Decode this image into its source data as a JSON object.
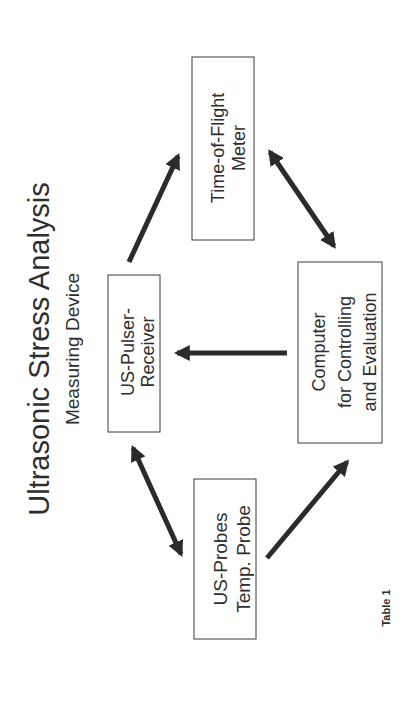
{
  "title": "Ultrasonic Stress Analysis",
  "subtitle": "Measuring Device",
  "caption": "Table 1",
  "nodes": {
    "tof": {
      "lines": [
        "Time-of-Flight",
        "Meter"
      ]
    },
    "pulser": {
      "lines": [
        "US-Pulser-",
        "Receiver"
      ]
    },
    "computer": {
      "lines": [
        "Computer",
        "for Controlling",
        "and Evaluation"
      ]
    },
    "probes": {
      "lines": [
        "US-Probes",
        "Temp. Probe"
      ]
    }
  },
  "edges": [
    {
      "from": "pulser",
      "to": "tof",
      "type": "one-way"
    },
    {
      "from": "tof",
      "to": "computer",
      "type": "two-way"
    },
    {
      "from": "computer",
      "to": "pulser",
      "type": "one-way"
    },
    {
      "from": "pulser",
      "to": "probes",
      "type": "two-way"
    },
    {
      "from": "probes",
      "to": "computer",
      "type": "one-way"
    }
  ]
}
